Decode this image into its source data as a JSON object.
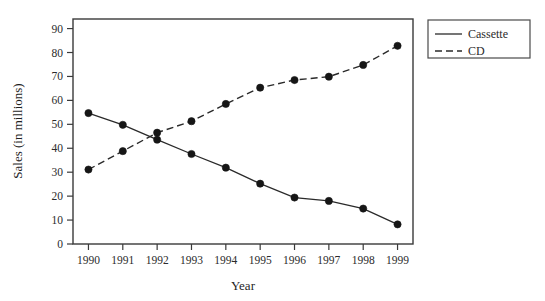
{
  "chart_data": {
    "type": "line",
    "title": "",
    "xlabel": "Year",
    "ylabel": "Sales (in millions)",
    "x": [
      1990,
      1991,
      1992,
      1993,
      1994,
      1995,
      1996,
      1997,
      1998,
      1999
    ],
    "xtick_labels": [
      "1990",
      "1991",
      "1992",
      "1993",
      "1994",
      "1995",
      "1996",
      "1997",
      "1998",
      "1999"
    ],
    "ytick_labels": [
      "0",
      "10",
      "20",
      "30",
      "40",
      "50",
      "60",
      "70",
      "80",
      "90"
    ],
    "yticks": [
      0,
      10,
      20,
      30,
      40,
      50,
      60,
      70,
      80,
      90
    ],
    "ylim": [
      0,
      94
    ],
    "xlim": [
      1989.55,
      1999.45
    ],
    "grid": false,
    "legend_position": "outside-top-right",
    "series": [
      {
        "name": "Cassette",
        "style": "solid",
        "marker": "filled-circle",
        "color": "#2a2a2a",
        "values": [
          54.7,
          49.8,
          43.6,
          37.6,
          31.9,
          25.2,
          19.4,
          18.0,
          14.8,
          8.2
        ]
      },
      {
        "name": "CD",
        "style": "dashed",
        "marker": "filled-circle",
        "color": "#2a2a2a",
        "values": [
          31.1,
          38.8,
          46.5,
          51.3,
          58.5,
          65.3,
          68.5,
          69.9,
          74.8,
          82.8
        ]
      }
    ]
  },
  "legend": {
    "items": [
      {
        "label": "Cassette",
        "style": "solid"
      },
      {
        "label": "CD",
        "style": "dashed"
      }
    ]
  }
}
